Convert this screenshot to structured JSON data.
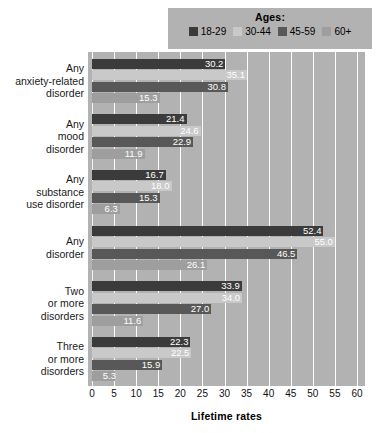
{
  "legend": {
    "title": "Ages:",
    "position": "top-right",
    "entries": [
      {
        "label": "18-29",
        "color": "#3b3b3b"
      },
      {
        "label": "30-44",
        "color": "#c9c9c9"
      },
      {
        "label": "45-59",
        "color": "#585858"
      },
      {
        "label": "60+",
        "color": "#9e9e9e"
      }
    ]
  },
  "chart_data": {
    "type": "bar",
    "orientation": "horizontal",
    "title": "",
    "xlabel": "Lifetime rates",
    "ylabel": "",
    "xlim": [
      0,
      60
    ],
    "xticks": [
      0,
      5,
      10,
      15,
      20,
      25,
      30,
      35,
      40,
      45,
      50,
      55,
      60
    ],
    "grid": true,
    "categories": [
      "Any anxiety-related disorder",
      "Any mood disorder",
      "Any substance use disorder",
      "Any disorder",
      "Two or more disorders",
      "Three or more disorders"
    ],
    "category_lines": [
      [
        "Any",
        "anxiety-related",
        "disorder"
      ],
      [
        "Any",
        "mood",
        "disorder"
      ],
      [
        "Any",
        "substance",
        "use disorder"
      ],
      [
        "Any",
        "disorder"
      ],
      [
        "Two",
        "or more",
        "disorders"
      ],
      [
        "Three",
        "or more",
        "disorders"
      ]
    ],
    "series": [
      {
        "name": "18-29",
        "color": "#3b3b3b",
        "values": [
          30.2,
          21.4,
          16.7,
          52.4,
          33.9,
          22.3
        ]
      },
      {
        "name": "30-44",
        "color": "#c9c9c9",
        "values": [
          35.1,
          24.6,
          18.0,
          55.0,
          34.0,
          22.5
        ]
      },
      {
        "name": "45-59",
        "color": "#585858",
        "values": [
          30.8,
          22.9,
          15.3,
          46.5,
          27.0,
          15.9
        ]
      },
      {
        "name": "60+",
        "color": "#9e9e9e",
        "values": [
          15.3,
          11.9,
          6.3,
          26.1,
          11.6,
          5.3
        ]
      }
    ],
    "value_labels": [
      [
        "30.2",
        "35.1",
        "30.8",
        "15.3"
      ],
      [
        "21.4",
        "24.6",
        "22.9",
        "11.9"
      ],
      [
        "16.7",
        "18.0",
        "15.3",
        "6.3"
      ],
      [
        "52.4",
        "55.0",
        "46.5",
        "26.1"
      ],
      [
        "33.9",
        "34.0",
        "27.0",
        "11.6"
      ],
      [
        "22.3",
        "22.5",
        "15.9",
        "5.3"
      ]
    ],
    "plot_background": "#b2b2b2",
    "gridline_color": "#ffffff"
  }
}
